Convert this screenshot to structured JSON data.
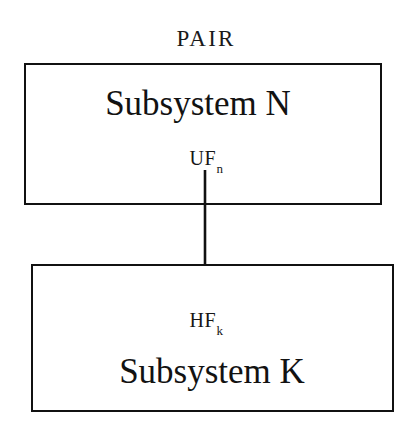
{
  "diagram": {
    "title": "PAIR",
    "background_color": "#ffffff",
    "line_color": "#111111",
    "boxes": [
      {
        "id": "subsystem-n",
        "label": "Subsystem N",
        "position": "top"
      },
      {
        "id": "subsystem-k",
        "label": "Subsystem K",
        "position": "bottom"
      }
    ],
    "flows": [
      {
        "id": "uf-n",
        "base": "UF",
        "subscript": "n",
        "full": "UFn",
        "origin": "subsystem-n"
      },
      {
        "id": "hf-k",
        "base": "HF",
        "subscript": "k",
        "full": "HFk",
        "target": "subsystem-k"
      }
    ],
    "connector": {
      "id": "flow-arrow",
      "from": "subsystem-n",
      "to": "subsystem-k",
      "direction": "down",
      "style": "solid",
      "arrowhead": "filled-triangle"
    }
  }
}
